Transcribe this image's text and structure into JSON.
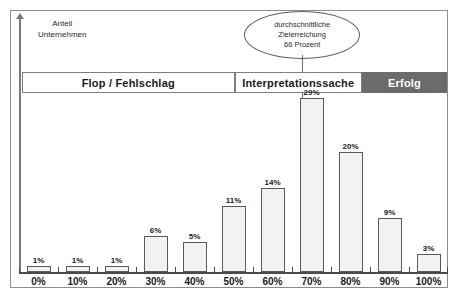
{
  "chart_data": {
    "type": "bar",
    "title": "",
    "subtitle": "",
    "xlabel": "",
    "ylabel": "Anteil\nUnternehmen",
    "categories": [
      "0%",
      "10%",
      "20%",
      "30%",
      "40%",
      "50%",
      "60%",
      "70%",
      "80%",
      "90%",
      "100%"
    ],
    "values": [
      1,
      1,
      1,
      6,
      5,
      11,
      14,
      29,
      20,
      9,
      3
    ],
    "value_labels": [
      "1%",
      "1%",
      "1%",
      "6%",
      "5%",
      "11%",
      "14%",
      "29%",
      "20%",
      "9%",
      "3%"
    ],
    "xlim": [
      0,
      100
    ],
    "ylim": [
      0,
      29
    ],
    "grid": false,
    "legend_position": "none",
    "bar_fill": "#f2f2f2",
    "bar_stroke": "#5a5a5a",
    "annotations": [
      {
        "name": "mean-callout",
        "text_lines": [
          "durchschnittliche",
          "Zielerreichung",
          "66 Prozent"
        ],
        "value": 66,
        "shape": "ellipse"
      }
    ],
    "bands": [
      {
        "label": "Flop / Fehlschlag",
        "from": 0,
        "to": 50,
        "fill": "#ffffff",
        "text_color": "#1a1a1a"
      },
      {
        "label": "Interpretationssache",
        "from": 50,
        "to": 80,
        "fill": "#ffffff",
        "text_color": "#1a1a1a"
      },
      {
        "label": "Erfolg",
        "from": 80,
        "to": 100,
        "fill": "#6b6b6b",
        "text_color": "#ffffff"
      }
    ]
  },
  "axis": {
    "y_caption": "Anteil\nUnternehmen"
  },
  "callout": {
    "line1": "durchschnittliche",
    "line2": "Zielerreichung",
    "line3": "66 Prozent"
  },
  "bands": {
    "flop": "Flop / Fehlschlag",
    "interpretation": "Interpretationssache",
    "erfolg": "Erfolg"
  },
  "colors": {
    "band_dark": "#6b6b6b",
    "band_light": "#ffffff",
    "bar_fill": "#f2f2f2",
    "bar_stroke": "#5a5a5a",
    "frame": "#8d8d8d",
    "axis": "#4a4a4a"
  }
}
